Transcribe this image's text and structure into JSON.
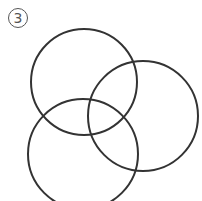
{
  "figure": {
    "label": "3",
    "stroke_color": "#333333",
    "stroke_width": 2,
    "circles": [
      {
        "name": "top-left-circle",
        "cx": 84,
        "cy": 82,
        "r": 53
      },
      {
        "name": "right-circle",
        "cx": 143,
        "cy": 116,
        "r": 55
      },
      {
        "name": "bottom-left-circle",
        "cx": 83,
        "cy": 154,
        "r": 55
      }
    ]
  }
}
